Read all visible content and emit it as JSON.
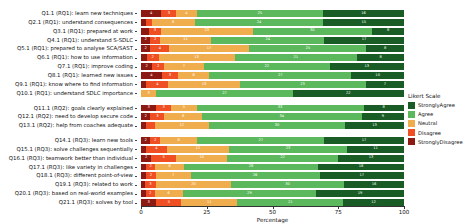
{
  "chart_data": {
    "type": "bar",
    "subtype": "stacked-horizontal-likert",
    "title": "",
    "xlabel": "Percentage",
    "ylabel": "",
    "xlim": [
      0,
      100
    ],
    "xticks": [
      0,
      25,
      50,
      75,
      100
    ],
    "grid": false,
    "legend": {
      "title": "Likert Scale",
      "position": "right",
      "entries": [
        {
          "label": "StronglyAgree",
          "color": "#1a5c26"
        },
        {
          "label": "Agree",
          "color": "#5cb85c"
        },
        {
          "label": "Neutral",
          "color": "#f0ad4e"
        },
        {
          "label": "Disagree",
          "color": "#f04e23"
        },
        {
          "label": "StronglyDisagree",
          "color": "#8c1a12"
        }
      ]
    },
    "series": [
      {
        "name": "StronglyDisagree",
        "color": "#8c1a12"
      },
      {
        "name": "Disagree",
        "color": "#f04e23"
      },
      {
        "name": "Neutral",
        "color": "#f0ad4e"
      },
      {
        "name": "Agree",
        "color": "#5cb85c"
      },
      {
        "name": "StronglyAgree",
        "color": "#1a5c26"
      }
    ],
    "groups": [
      {
        "name": "RQ1",
        "rows": [
          {
            "label": "Q1.1 (RQ1): learn new techniques",
            "values": [
              4,
              3,
              4,
              25,
              16
            ]
          },
          {
            "label": "Q2.1 (RQ1): understand consequences",
            "values": [
              1,
              1,
              8,
              24,
              15
            ]
          },
          {
            "label": "Q3.1 (RQ1): prepared at work",
            "values": [
              2,
              3,
              23,
              30,
              8
            ]
          },
          {
            "label": "Q4.1 (RQ1): understand S-SDLC",
            "values": [
              2,
              2,
              11,
              24,
              17
            ]
          },
          {
            "label": "Q5.1 (RQ1): prepared to analyse SCA/SAST",
            "values": [
              2,
              4,
              17,
              25,
              8
            ]
          },
          {
            "label": "Q6.1 (RQ1): how to use information",
            "values": [
              1,
              2,
              13,
              21,
              8
            ]
          },
          {
            "label": "Q7.1 (RQ1): improve coding",
            "values": [
              2,
              2,
              7,
              22,
              13
            ]
          },
          {
            "label": "Q8.1 (RQ1): learned new issues",
            "values": [
              4,
              3,
              6,
              27,
              10
            ]
          },
          {
            "label": "Q9.1 (RQ1): know where to find information",
            "values": [
              1,
              4,
              13,
              23,
              7
            ]
          },
          {
            "label": "Q10.1 (RQ1): understand SDLC importance",
            "values": [
              0,
              0,
              3,
              27,
              22
            ]
          }
        ]
      },
      {
        "name": "RQ2",
        "rows": [
          {
            "label": "Q11.1 (RQ2): goals clearly explained",
            "values": [
              3,
              3,
              5,
              33,
              8
            ]
          },
          {
            "label": "Q12.1 (RQ2): need to develop secure code",
            "values": [
              2,
              3,
              8,
              34,
              9
            ]
          },
          {
            "label": "Q13.1 (RQ2): help from coaches adequate",
            "values": [
              1,
              2,
              12,
              30,
              13
            ]
          }
        ]
      },
      {
        "name": "RQ3",
        "rows": [
          {
            "label": "Q14.1 (RQ3): learn new tools",
            "values": [
              2,
              2,
              8,
              27,
              17
            ]
          },
          {
            "label": "Q15.1 (RQ3): solve challenges sequentially",
            "values": [
              1,
              4,
              12,
              23,
              11
            ]
          },
          {
            "label": "Q16.1 (RQ3): teamwork better than individual",
            "values": [
              2,
              5,
              10,
              22,
              13
            ]
          },
          {
            "label": "Q17.1 (RQ3): like variety in challenges",
            "values": [
              1,
              2,
              6,
              28,
              18
            ]
          },
          {
            "label": "Q18.1 (RQ3): different point-of-view",
            "values": [
              1,
              2,
              7,
              26,
              17
            ]
          },
          {
            "label": "Q19.1 (RQ3): related to work",
            "values": [
              1,
              3,
              20,
              30,
              16
            ]
          },
          {
            "label": "Q20.1 (RQ3): based on real-world examples",
            "values": [
              1,
              2,
              6,
              29,
              19
            ]
          },
          {
            "label": "Q21.1 (RQ3): solves by tool",
            "values": [
              3,
              5,
              11,
              21,
              12
            ]
          }
        ]
      }
    ]
  }
}
